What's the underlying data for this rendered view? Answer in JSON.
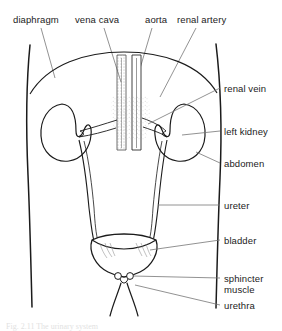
{
  "figure": {
    "background_color": "#ffffff",
    "line_color": "#1b1b1b",
    "organ_fill": "#ffffff",
    "width": 282,
    "height": 331
  },
  "labels": {
    "top": [
      {
        "id": "diaphragm",
        "text": "diaphragm",
        "x": 13,
        "y": 14
      },
      {
        "id": "vena-cava",
        "text": "vena cava",
        "x": 75,
        "y": 14
      },
      {
        "id": "aorta",
        "text": "aorta",
        "x": 145,
        "y": 14
      },
      {
        "id": "renal-artery",
        "text": "renal artery",
        "x": 177,
        "y": 14
      }
    ],
    "right": [
      {
        "id": "renal-vein",
        "text": "renal vein",
        "x": 222,
        "y": 83
      },
      {
        "id": "left-kidney",
        "text": "left kidney",
        "x": 222,
        "y": 126
      },
      {
        "id": "abdomen",
        "text": "abdomen",
        "x": 222,
        "y": 158
      },
      {
        "id": "ureter",
        "text": "ureter",
        "x": 222,
        "y": 200
      },
      {
        "id": "bladder",
        "text": "bladder",
        "x": 222,
        "y": 235
      },
      {
        "id": "sphincter-muscle",
        "text": "sphincter\nmuscle",
        "x": 222,
        "y": 273
      },
      {
        "id": "urethra",
        "text": "urethra",
        "x": 222,
        "y": 300
      }
    ]
  },
  "caption": {
    "text": "Fig. 2.11   The urinary system"
  }
}
